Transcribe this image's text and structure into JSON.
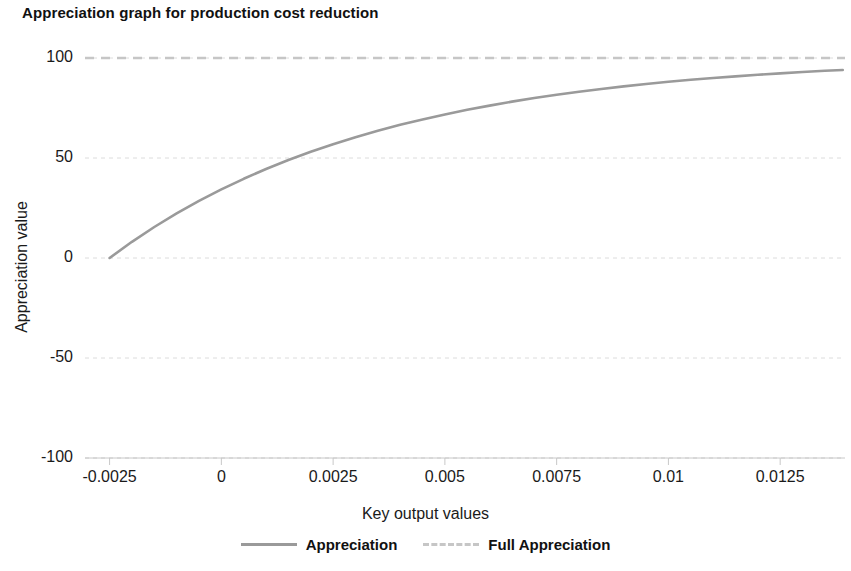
{
  "chart_data": {
    "type": "line",
    "title": "Appreciation graph for production cost reduction",
    "xlabel": "Key output values",
    "ylabel": "Appreciation value",
    "xlim": [
      -0.00305,
      0.01395
    ],
    "ylim": [
      -100,
      105
    ],
    "grid": true,
    "grid_axis": "y",
    "grid_style": "dashed",
    "legend_position": "bottom-center",
    "x_ticks": [
      -0.0025,
      0,
      0.0025,
      0.005,
      0.0075,
      0.01,
      0.0125
    ],
    "x_tick_labels": [
      "-0.0025",
      "0",
      "0.0025",
      "0.005",
      "0.0075",
      "0.01",
      "0.0125"
    ],
    "y_ticks": [
      -100,
      -50,
      0,
      50,
      100
    ],
    "y_tick_labels": [
      "-100",
      "-50",
      "0",
      "50",
      "100"
    ],
    "series": [
      {
        "name": "Appreciation",
        "style": "solid",
        "color": "#9a9a9a",
        "x": [
          -0.0025,
          -0.002,
          -0.0015,
          -0.001,
          -0.0005,
          0,
          0.0005,
          0.001,
          0.0015,
          0.002,
          0.0025,
          0.003,
          0.0035,
          0.004,
          0.0045,
          0.005,
          0.0055,
          0.006,
          0.0065,
          0.007,
          0.0075,
          0.008,
          0.0085,
          0.009,
          0.0095,
          0.01,
          0.0105,
          0.011,
          0.0115,
          0.012,
          0.0125,
          0.013,
          0.0135,
          0.0139
        ],
        "y": [
          0,
          8.1,
          15.5,
          22.3,
          28.6,
          34.3,
          39.6,
          44.5,
          49.0,
          53.1,
          56.9,
          60.4,
          63.6,
          66.6,
          69.3,
          71.8,
          74.1,
          76.2,
          78.2,
          80.0,
          81.6,
          83.1,
          84.5,
          85.8,
          87.0,
          88.1,
          89.1,
          90.0,
          90.8,
          91.6,
          92.3,
          93.0,
          93.6,
          94.0
        ]
      },
      {
        "name": "Full Appreciation",
        "style": "dashed",
        "color": "#c6c6c6",
        "constant_value": 100,
        "x": [
          -0.00305,
          0.01395
        ],
        "y": [
          100,
          100
        ]
      }
    ],
    "legend_entries": [
      {
        "label": "Appreciation",
        "style": "solid",
        "color": "#9a9a9a"
      },
      {
        "label": "Full Appreciation",
        "style": "dashed",
        "color": "#c6c6c6"
      }
    ],
    "annotations": []
  },
  "colors": {
    "background": "#ffffff",
    "text": "#1a1a1a",
    "grid": "#dcdcdc",
    "axis": "#bbbbbb",
    "series_appreciation": "#9a9a9a",
    "series_full_appreciation": "#c6c6c6"
  }
}
